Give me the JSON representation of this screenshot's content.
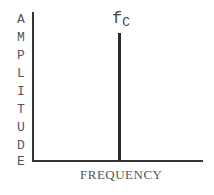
{
  "diagram": {
    "type": "frequency-spectrum",
    "y_axis_label": "AMPLITUDE",
    "y_axis_letters": [
      "A",
      "M",
      "P",
      "L",
      "I",
      "T",
      "U",
      "D",
      "E"
    ],
    "x_axis_label": "FREQUENCY",
    "spike_label": {
      "main": "f",
      "subscript": "C"
    }
  }
}
